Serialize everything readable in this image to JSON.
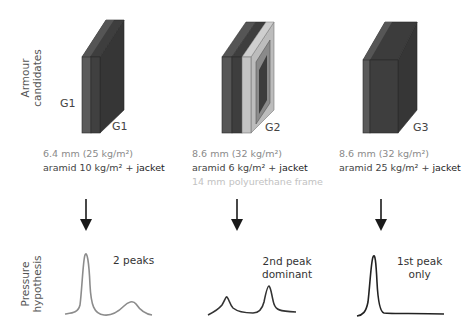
{
  "row_labels": {
    "top": [
      "Armour",
      "candidates"
    ],
    "bottom": [
      "Pressure",
      "hypothesis"
    ]
  },
  "candidates": [
    {
      "id": "G1",
      "left_tag": "G1",
      "tag": "G1",
      "thickness": "6.4 mm (25 kg/m²)",
      "composition_prefix": "aramid 10 kg/m² + ",
      "composition_suffix": "jacket",
      "extra": "",
      "pressure_note": [
        "2 peaks"
      ],
      "curve_color": "#8c8c8c"
    },
    {
      "id": "G2",
      "tag": "G2",
      "thickness": "8.6 mm (32 kg/m²)",
      "composition_prefix": "aramid 6 kg/m² + ",
      "composition_suffix": "jacket",
      "extra": "14 mm polyurethane frame",
      "pressure_note": [
        "2nd peak",
        "dominant"
      ],
      "curve_color": "#333333"
    },
    {
      "id": "G3",
      "tag": "G3",
      "thickness": "8.6 mm (32 kg/m²)",
      "composition_prefix": "aramid 25 kg/m² + ",
      "composition_suffix": "jacket",
      "extra": "",
      "pressure_note": [
        "1st peak",
        "only"
      ],
      "curve_color": "#222222"
    }
  ],
  "colors": {
    "block_dark": "#3a3a3a",
    "block_mid": "#4a4a4a",
    "block_light_layer": "#5e5e5e",
    "frame_light": "#bdbdbd",
    "arrow": "#1a1a1a"
  }
}
